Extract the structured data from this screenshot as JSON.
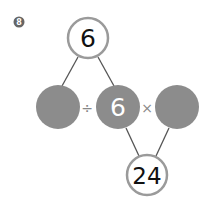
{
  "question": {
    "number": "8"
  },
  "diagram": {
    "top": {
      "value": "6"
    },
    "left": {
      "value": ""
    },
    "middle": {
      "value": "6"
    },
    "right": {
      "value": ""
    },
    "bottom": {
      "value": "24"
    },
    "operators": {
      "divide": "÷",
      "times": "×"
    }
  },
  "colors": {
    "filled_circle": "#8c8c8c",
    "outline": "#9a9a9a",
    "line": "#555555",
    "badge": "#666666"
  }
}
